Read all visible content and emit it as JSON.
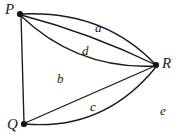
{
  "figure": {
    "kind": "multigraph-diagram",
    "background_color": "#ffffff",
    "stroke_color": "#1a1a1a",
    "width": 178,
    "height": 137
  },
  "vertices": [
    {
      "id": "P",
      "label": "P",
      "x": 20,
      "y": 14
    },
    {
      "id": "Q",
      "label": "Q",
      "x": 24,
      "y": 124
    },
    {
      "id": "R",
      "label": "R",
      "x": 156,
      "y": 65
    }
  ],
  "edges": [
    {
      "id": "edge-pr-upper",
      "from": "P",
      "to": "R",
      "shape": "arc-up",
      "label": ""
    },
    {
      "id": "edge-pr-middle",
      "from": "P",
      "to": "R",
      "shape": "straight",
      "label": ""
    },
    {
      "id": "edge-pr-lower",
      "from": "P",
      "to": "R",
      "shape": "arc-down",
      "label": ""
    },
    {
      "id": "edge-pq",
      "from": "P",
      "to": "Q",
      "shape": "straight",
      "label": ""
    },
    {
      "id": "edge-qr-upper",
      "from": "Q",
      "to": "R",
      "shape": "straight",
      "label": ""
    },
    {
      "id": "edge-qr-lower",
      "from": "Q",
      "to": "R",
      "shape": "arc-down",
      "label": ""
    }
  ],
  "labels": {
    "a": "a",
    "b": "b",
    "c": "c",
    "d": "d",
    "e": "e"
  }
}
